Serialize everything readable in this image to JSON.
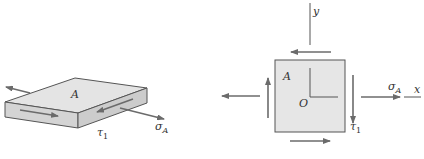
{
  "figure": {
    "left_view": {
      "face_label": "A",
      "shear_label": "τ",
      "shear_subscript": "1",
      "stress_label": "σ",
      "stress_subscript": "A"
    },
    "right_view": {
      "element_label": "A",
      "origin_label": "O",
      "x_axis_label": "x",
      "y_axis_label": "y",
      "shear_label": "τ",
      "shear_subscript": "1",
      "stress_label": "σ",
      "stress_subscript": "A"
    },
    "colors": {
      "face_top": "#e4e4e4",
      "face_side": "#d0d0d0",
      "element_fill": "#e6e6e6",
      "edge": "#555555",
      "arrow": "#6b6b6b"
    }
  }
}
